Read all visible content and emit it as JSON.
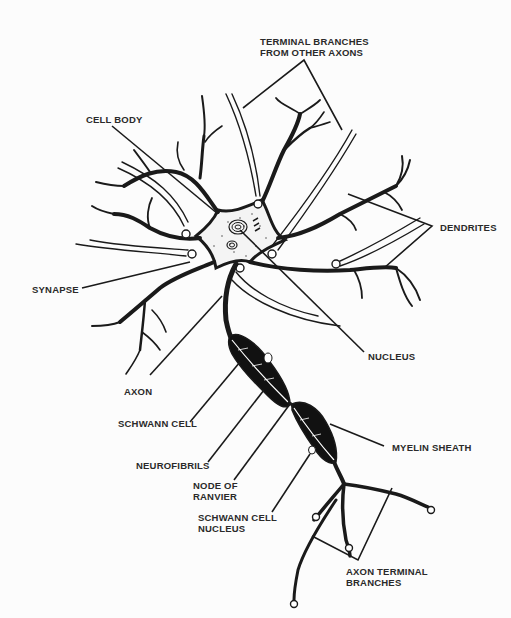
{
  "diagram": {
    "labels": {
      "terminal_branches_other_axons": "TERMINAL BRANCHES\nFROM OTHER AXONS",
      "terminal_branches_line1": "TERMINAL BRANCHES",
      "terminal_branches_line2": "FROM OTHER AXONS",
      "cell_body": "CELL BODY",
      "dendrites": "DENDRITES",
      "synapse": "SYNAPSE",
      "nucleus": "NUCLEUS",
      "axon": "AXON",
      "schwann_cell": "SCHWANN CELL",
      "neurofibrils": "NEUROFIBRILS",
      "node_of_ranvier_line1": "NODE OF",
      "node_of_ranvier_line2": "RANVIER",
      "myelin_sheath": "MYELIN SHEATH",
      "schwann_cell_nucleus_line1": "SCHWANN CELL",
      "schwann_cell_nucleus_line2": "NUCLEUS",
      "axon_terminal_branches_line1": "AXON TERMINAL",
      "axon_terminal_branches_line2": "BRANCHES"
    },
    "colors": {
      "ink": "#1a1a1a",
      "label_text": "#2a2a2a",
      "background": "#fcfcfc",
      "myelin_fill": "#111111"
    }
  }
}
